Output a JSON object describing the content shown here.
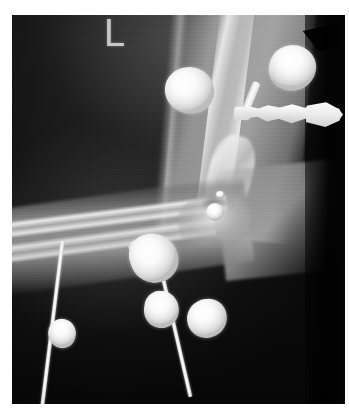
{
  "image": {
    "modality": "radiograph",
    "body_part": "elbow and forearm, lateral view",
    "background_color": "#ffffff",
    "film_color": "#050505",
    "width": 349,
    "height": 418
  },
  "markers": {
    "laterality": "L"
  },
  "anatomy": [
    {
      "name": "humerus-shaft",
      "label": "humerus"
    },
    {
      "name": "distal-humerus",
      "label": "distal humerus"
    },
    {
      "name": "elbow-joint",
      "label": "elbow joint"
    },
    {
      "name": "olecranon",
      "label": "olecranon"
    },
    {
      "name": "ulna-shaft",
      "label": "ulna"
    },
    {
      "name": "radius-shaft",
      "label": "radius"
    },
    {
      "name": "upper-arm-soft-tissue",
      "label": "upper arm soft tissue"
    },
    {
      "name": "forearm-soft-tissue",
      "label": "forearm soft tissue"
    }
  ],
  "radiopaque_objects": [
    {
      "name": "fragment-upper-arm",
      "type": "metallic fragment",
      "shade": "#ffffff"
    },
    {
      "name": "fragment-upper-right",
      "type": "metallic fragment",
      "shade": "#ffffff"
    },
    {
      "name": "fragment-forearm-large",
      "type": "metallic fragment",
      "shade": "#ffffff"
    },
    {
      "name": "fragment-forearm-middle",
      "type": "metallic fragment",
      "shade": "#ffffff"
    },
    {
      "name": "fragment-forearm-lower",
      "type": "metallic fragment",
      "shade": "#ffffff"
    },
    {
      "name": "fragment-distal-forearm",
      "type": "metallic fragment",
      "shade": "#ffffff"
    },
    {
      "name": "fragment-joint",
      "type": "metallic fragment",
      "shade": "#ffffff"
    },
    {
      "name": "fragment-joint-small",
      "type": "metallic fragment",
      "shade": "#ffffff"
    }
  ],
  "hardware": [
    {
      "name": "external-fixator-clamp",
      "type": "threaded clamp assembly"
    },
    {
      "name": "fixator-pin",
      "type": "pin"
    },
    {
      "name": "k-wire-left",
      "type": "Kirschner wire"
    },
    {
      "name": "k-wire-right",
      "type": "Kirschner wire"
    }
  ]
}
